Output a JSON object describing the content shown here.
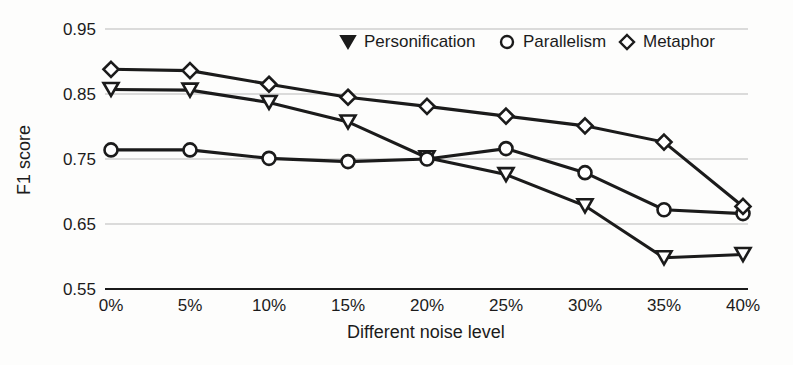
{
  "chart_data": {
    "type": "line",
    "title": "",
    "subtitle": "",
    "xlabel": "Different noise level",
    "ylabel": "F1 score",
    "categories": [
      "0%",
      "5%",
      "10%",
      "15%",
      "20%",
      "25%",
      "30%",
      "35%",
      "40%"
    ],
    "x_tick_labels": [
      "0%",
      "5%",
      "10%",
      "15%",
      "20%",
      "25%",
      "30%",
      "35%",
      "40%"
    ],
    "y_tick_labels": [
      "0.55",
      "0.65",
      "0.75",
      "0.85",
      "0.95"
    ],
    "y_ticks": [
      0.55,
      0.65,
      0.75,
      0.85,
      0.95
    ],
    "ylim": [
      0.55,
      0.95
    ],
    "grid": true,
    "grid_axis": "y",
    "legend_position": "top-right-inside",
    "series": [
      {
        "name": "Personification",
        "marker": "triangle-down",
        "values": [
          0.857,
          0.856,
          0.837,
          0.807,
          0.752,
          0.726,
          0.678,
          0.598,
          0.603
        ]
      },
      {
        "name": "Parallelism",
        "marker": "circle",
        "values": [
          0.764,
          0.764,
          0.751,
          0.746,
          0.75,
          0.766,
          0.729,
          0.672,
          0.666
        ]
      },
      {
        "name": "Metaphor",
        "marker": "diamond",
        "values": [
          0.888,
          0.886,
          0.865,
          0.845,
          0.831,
          0.816,
          0.801,
          0.776,
          0.677
        ]
      }
    ],
    "colors": {
      "line": "#1b1b1b",
      "marker_fill": "#ffffff",
      "grid": "#b9b9b9",
      "background": "#fdfdfc"
    }
  },
  "legend": {
    "items": [
      {
        "label": "Personification",
        "marker": "triangle-down-icon"
      },
      {
        "label": "Parallelism",
        "marker": "circle-icon"
      },
      {
        "label": "Metaphor",
        "marker": "diamond-icon"
      }
    ]
  },
  "axes": {
    "x_title": "Different noise level",
    "y_title": "F1 score"
  }
}
